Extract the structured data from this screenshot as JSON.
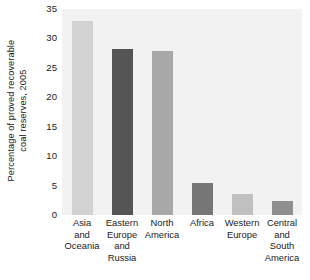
{
  "chart_data": {
    "type": "bar",
    "title": "",
    "subtitle": "",
    "xlabel": "",
    "ylabel": "Percentage of proved recoverable coal reserves, 2005",
    "ylabel_lines": [
      "Percentage of proved recoverable",
      "coal reserves, 2005"
    ],
    "ylim": [
      0,
      35
    ],
    "yticks": [
      0,
      5,
      10,
      15,
      20,
      25,
      30,
      35
    ],
    "ytick_labels": [
      "0",
      "5",
      "10",
      "15",
      "20",
      "25",
      "30",
      "35"
    ],
    "grid": false,
    "legend": "none",
    "categories": [
      "Asia and Oceania",
      "Eastern Europe and Russia",
      "North America",
      "Africa",
      "Western Europe",
      "Central and South America"
    ],
    "category_lines": [
      [
        "Asia",
        "and",
        "Oceania"
      ],
      [
        "Eastern",
        "Europe",
        "and",
        "Russia"
      ],
      [
        "North",
        "America"
      ],
      [
        "Africa"
      ],
      [
        "Western",
        "Europe"
      ],
      [
        "Central",
        "and",
        "South",
        "America"
      ]
    ],
    "values": [
      33.0,
      28.2,
      27.8,
      5.5,
      3.6,
      2.3
    ],
    "bar_colors": [
      "#d2d2d2",
      "#555555",
      "#a8a8a8",
      "#777777",
      "#c0c0c0",
      "#8f8f8f"
    ],
    "plot_background": "#f2f2f2",
    "figure_background": "#ffffff",
    "text_color": "#1a1a1a"
  }
}
